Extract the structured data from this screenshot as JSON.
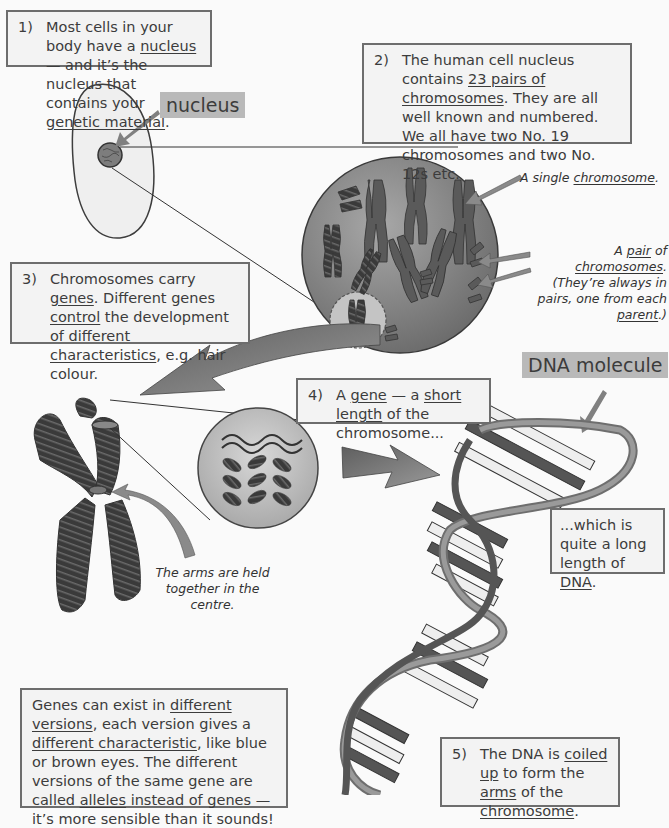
{
  "boxes": {
    "b1": {
      "num": "1)",
      "parts": [
        {
          "t": "Most cells in your body have a "
        },
        {
          "t": "nucleus",
          "u": true
        },
        {
          "t": " — and it’s the nucleus that contains your "
        },
        {
          "t": "genetic material",
          "u": true
        },
        {
          "t": "."
        }
      ]
    },
    "b2": {
      "num": "2)",
      "parts": [
        {
          "t": "The human cell nucleus contains "
        },
        {
          "t": "23 pairs of chromosomes",
          "u": true
        },
        {
          "t": ".  They are all well known and numbered.  We all have two No. 19 chromosomes and two No. 12s etc."
        }
      ]
    },
    "b3": {
      "num": "3)",
      "parts": [
        {
          "t": "Chromosomes carry "
        },
        {
          "t": "genes",
          "u": true
        },
        {
          "t": ". Different genes "
        },
        {
          "t": "control",
          "u": true
        },
        {
          "t": " the development of different "
        },
        {
          "t": "characteristics",
          "u": true
        },
        {
          "t": ", e.g. hair colour."
        }
      ]
    },
    "b4": {
      "num": "4)",
      "parts": [
        {
          "t": "A "
        },
        {
          "t": "gene",
          "u": true
        },
        {
          "t": " — a "
        },
        {
          "t": "short length",
          "u": true
        },
        {
          "t": " of the chromosome..."
        }
      ]
    },
    "b_dna": {
      "parts": [
        {
          "t": "...which is quite a long length of "
        },
        {
          "t": "DNA",
          "u": true
        },
        {
          "t": "."
        }
      ]
    },
    "b_alleles": {
      "parts": [
        {
          "t": "Genes can exist in "
        },
        {
          "t": "different versions",
          "u": true
        },
        {
          "t": ", each version gives a "
        },
        {
          "t": "different characteristic",
          "u": true
        },
        {
          "t": ", like blue or brown eyes. The different versions of the same gene are called "
        },
        {
          "t": "alleles",
          "u": true
        },
        {
          "t": " instead of genes — it’s more sensible than it sounds!"
        }
      ]
    },
    "b5": {
      "num": "5)",
      "parts": [
        {
          "t": "The DNA is "
        },
        {
          "t": "coiled up",
          "u": true
        },
        {
          "t": " to form the "
        },
        {
          "t": "arms",
          "u": true
        },
        {
          "t": " of the "
        },
        {
          "t": "chromosome",
          "u": true
        },
        {
          "t": "."
        }
      ]
    }
  },
  "labels": {
    "nucleus": "nucleus",
    "dna_molecule": "DNA molecule"
  },
  "notes": {
    "single": [
      {
        "t": "A single "
      },
      {
        "t": "chromosome",
        "u": true
      },
      {
        "t": "."
      }
    ],
    "pair": [
      {
        "t": "A "
      },
      {
        "t": "pair",
        "u": true
      },
      {
        "t": " of "
      },
      {
        "t": "chromosomes",
        "u": true
      },
      {
        "t": ". (They’re always in pairs, one from each "
      },
      {
        "t": "parent",
        "u": true
      },
      {
        "t": ".)"
      }
    ],
    "arms": [
      {
        "t": "The arms are held together in the centre."
      }
    ]
  },
  "colors": {
    "box_bg": "#f3f3f3",
    "box_border": "#6d6d6d",
    "tag_bg": "#b9b9b9",
    "arrow": "#7a7a7a",
    "nucleus_sphere": "#8a8a8a",
    "dark": "#3a3a3a"
  }
}
